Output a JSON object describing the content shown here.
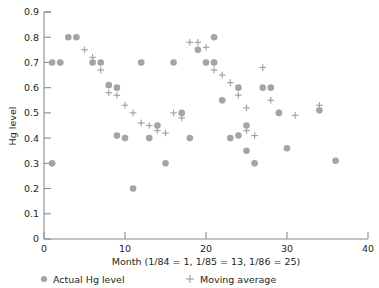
{
  "chart_data": {
    "type": "scatter",
    "title": "",
    "xlabel": "Month (1/84 = 1, 1/85 = 13, 1/86 = 25)",
    "ylabel": "Hg level",
    "xlim": [
      0,
      40
    ],
    "ylim": [
      0,
      0.9
    ],
    "xticks": [
      0,
      10,
      20,
      30,
      40
    ],
    "xtick_labels": [
      "0",
      "10",
      "20",
      "30",
      "40"
    ],
    "yticks": [
      0,
      0.1,
      0.2,
      0.3,
      0.4,
      0.5,
      0.6,
      0.7,
      0.8,
      0.9
    ],
    "ytick_labels": [
      "0",
      "0.1",
      "0.2",
      "0.3",
      "0.4",
      "0.5",
      "0.6",
      "0.7",
      "0.8",
      "0.9"
    ],
    "grid": false,
    "legend_position": "below-axis",
    "series": [
      {
        "name": "Actual Hg level",
        "marker": "circle",
        "color": "#a3a3a8",
        "points": [
          [
            1,
            0.3
          ],
          [
            1,
            0.7
          ],
          [
            2,
            0.7
          ],
          [
            3,
            0.8
          ],
          [
            4,
            0.8
          ],
          [
            6,
            0.7
          ],
          [
            7,
            0.7
          ],
          [
            8,
            0.61
          ],
          [
            9,
            0.6
          ],
          [
            9,
            0.41
          ],
          [
            10,
            0.4
          ],
          [
            11,
            0.2
          ],
          [
            12,
            0.7
          ],
          [
            13,
            0.4
          ],
          [
            14,
            0.45
          ],
          [
            15,
            0.3
          ],
          [
            16,
            0.7
          ],
          [
            17,
            0.5
          ],
          [
            18,
            0.4
          ],
          [
            19,
            0.75
          ],
          [
            20,
            0.7
          ],
          [
            21,
            0.7
          ],
          [
            21,
            0.8
          ],
          [
            22,
            0.55
          ],
          [
            23,
            0.4
          ],
          [
            24,
            0.6
          ],
          [
            24,
            0.41
          ],
          [
            25,
            0.45
          ],
          [
            25,
            0.35
          ],
          [
            26,
            0.3
          ],
          [
            27,
            0.6
          ],
          [
            28,
            0.6
          ],
          [
            29,
            0.5
          ],
          [
            30,
            0.36
          ],
          [
            34,
            0.51
          ],
          [
            36,
            0.31
          ]
        ]
      },
      {
        "name": "Moving average",
        "marker": "plus",
        "color": "#a3a3a8",
        "points": [
          [
            1,
            0.3
          ],
          [
            2,
            0.7
          ],
          [
            5,
            0.75
          ],
          [
            6,
            0.72
          ],
          [
            7,
            0.67
          ],
          [
            8,
            0.58
          ],
          [
            9,
            0.57
          ],
          [
            10,
            0.53
          ],
          [
            11,
            0.5
          ],
          [
            12,
            0.46
          ],
          [
            13,
            0.45
          ],
          [
            14,
            0.43
          ],
          [
            15,
            0.42
          ],
          [
            16,
            0.5
          ],
          [
            17,
            0.48
          ],
          [
            18,
            0.78
          ],
          [
            19,
            0.78
          ],
          [
            20,
            0.76
          ],
          [
            21,
            0.7
          ],
          [
            21,
            0.67
          ],
          [
            22,
            0.65
          ],
          [
            23,
            0.62
          ],
          [
            24,
            0.57
          ],
          [
            25,
            0.52
          ],
          [
            25,
            0.43
          ],
          [
            26,
            0.41
          ],
          [
            27,
            0.68
          ],
          [
            28,
            0.55
          ],
          [
            29,
            0.5
          ],
          [
            31,
            0.49
          ],
          [
            34,
            0.53
          ]
        ]
      }
    ]
  },
  "legend": {
    "items": [
      {
        "label": "Actual Hg level",
        "marker": "circle"
      },
      {
        "label": "Moving average",
        "marker": "plus"
      }
    ]
  }
}
